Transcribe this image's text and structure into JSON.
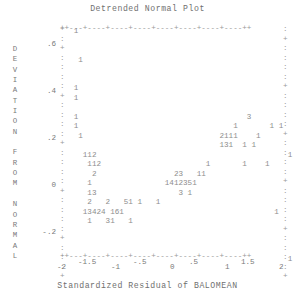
{
  "chart_data": {
    "type": "scatter",
    "title": "Detrended Normal Plot",
    "xlabel": "Standardized Residual of BALOMEAN",
    "ylabel": "DEVIATION FROM NORMAL",
    "grid": false,
    "legend": "none",
    "xlim": [
      -2,
      2
    ],
    "ylim": [
      -0.32,
      0.68
    ],
    "xticks": [
      -2,
      -1.5,
      -1,
      -0.5,
      0,
      0.5,
      1,
      1.5,
      2
    ],
    "xtick_labels": [
      "-2",
      "-1.5",
      "-1",
      "-.5",
      "0",
      ".5",
      "1",
      "1.5",
      "2"
    ],
    "yticks": [
      0.6,
      0.4,
      0.2,
      0,
      -0.2
    ],
    "ytick_labels": [
      ".6",
      ".4",
      ".2",
      "0",
      "-.2"
    ],
    "note": "ASCII character plot; each printed digit is a count of overlapping cases at that cell",
    "points": [
      {
        "x": -1.74,
        "y": 0.655,
        "count": 1
      },
      {
        "x": -1.68,
        "y": 0.505,
        "count": 1
      },
      {
        "x": -1.74,
        "y": 0.335,
        "count": 1
      },
      {
        "x": -1.74,
        "y": 0.295,
        "count": 1
      },
      {
        "x": -1.74,
        "y": 0.225,
        "count": 1
      },
      {
        "x": -1.7,
        "y": 0.185,
        "count": 1
      },
      {
        "x": -1.6,
        "y": 0.105,
        "count": 1
      },
      {
        "x": -1.54,
        "y": 0.105,
        "count": 1
      },
      {
        "x": -1.48,
        "y": 0.105,
        "count": 2
      },
      {
        "x": -1.56,
        "y": 0.065,
        "count": 1
      },
      {
        "x": -1.5,
        "y": 0.065,
        "count": 1
      },
      {
        "x": -1.44,
        "y": 0.065,
        "count": 2
      },
      {
        "x": -1.52,
        "y": 0.025,
        "count": 2
      },
      {
        "x": -1.54,
        "y": -0.015,
        "count": 1
      },
      {
        "x": -1.54,
        "y": -0.055,
        "count": 1
      },
      {
        "x": -1.48,
        "y": -0.055,
        "count": 3
      },
      {
        "x": -1.52,
        "y": -0.095,
        "count": 2
      },
      {
        "x": -1.36,
        "y": -0.095,
        "count": 2
      },
      {
        "x": -1.16,
        "y": -0.095,
        "count": 5
      },
      {
        "x": -1.1,
        "y": -0.095,
        "count": 1
      },
      {
        "x": -0.98,
        "y": -0.095,
        "count": 1
      },
      {
        "x": -0.88,
        "y": -0.095,
        "count": 1
      },
      {
        "x": -1.54,
        "y": -0.135,
        "count": 1
      },
      {
        "x": -1.48,
        "y": -0.135,
        "count": 3
      },
      {
        "x": -1.42,
        "y": -0.135,
        "count": 4
      },
      {
        "x": -1.36,
        "y": -0.135,
        "count": 2
      },
      {
        "x": -1.3,
        "y": -0.135,
        "count": 4
      },
      {
        "x": -1.18,
        "y": -0.135,
        "count": 1
      },
      {
        "x": -1.12,
        "y": -0.135,
        "count": 6
      },
      {
        "x": -1.06,
        "y": -0.135,
        "count": 1
      },
      {
        "x": -1.5,
        "y": -0.175,
        "count": 1
      },
      {
        "x": -1.32,
        "y": -0.175,
        "count": 3
      },
      {
        "x": -1.26,
        "y": -0.175,
        "count": 1
      },
      {
        "x": -1.1,
        "y": -0.175,
        "count": 1
      },
      {
        "x": -0.28,
        "y": -0.015,
        "count": 2
      },
      {
        "x": -0.22,
        "y": -0.015,
        "count": 3
      },
      {
        "x": -0.08,
        "y": -0.015,
        "count": 1
      },
      {
        "x": -0.02,
        "y": -0.015,
        "count": 1
      },
      {
        "x": -0.32,
        "y": -0.055,
        "count": 1
      },
      {
        "x": -0.26,
        "y": -0.055,
        "count": 4
      },
      {
        "x": -0.2,
        "y": -0.055,
        "count": 1
      },
      {
        "x": -0.14,
        "y": -0.055,
        "count": 2
      },
      {
        "x": -0.08,
        "y": -0.055,
        "count": 3
      },
      {
        "x": -0.02,
        "y": -0.055,
        "count": 5
      },
      {
        "x": 0.04,
        "y": -0.055,
        "count": 1
      },
      {
        "x": -0.08,
        "y": -0.095,
        "count": 3
      },
      {
        "x": 0.0,
        "y": -0.095,
        "count": 1
      },
      {
        "x": 0.62,
        "y": 0.145,
        "count": 3
      },
      {
        "x": 0.56,
        "y": 0.105,
        "count": 1
      },
      {
        "x": 1.12,
        "y": 0.105,
        "count": 1
      },
      {
        "x": 1.26,
        "y": 0.105,
        "count": 1
      },
      {
        "x": 0.46,
        "y": 0.065,
        "count": 2
      },
      {
        "x": 0.52,
        "y": 0.065,
        "count": 1
      },
      {
        "x": 0.58,
        "y": 0.065,
        "count": 1
      },
      {
        "x": 0.64,
        "y": 0.065,
        "count": 1
      },
      {
        "x": 0.88,
        "y": 0.065,
        "count": 1
      },
      {
        "x": 0.46,
        "y": 0.025,
        "count": 1
      },
      {
        "x": 0.52,
        "y": 0.025,
        "count": 3
      },
      {
        "x": 0.58,
        "y": 0.025,
        "count": 1
      },
      {
        "x": 0.8,
        "y": 0.025,
        "count": 1
      },
      {
        "x": 0.94,
        "y": 0.025,
        "count": 1
      },
      {
        "x": 1.4,
        "y": -0.015,
        "count": 1
      },
      {
        "x": 0.46,
        "y": -0.055,
        "count": 1
      },
      {
        "x": 0.94,
        "y": -0.055,
        "count": 1
      },
      {
        "x": 1.22,
        "y": -0.055,
        "count": 1
      },
      {
        "x": 1.82,
        "y": -0.215,
        "count": 1
      },
      {
        "x": 1.88,
        "y": -0.295,
        "count": 1
      }
    ]
  },
  "axis": {
    "top_row": "++---+----+----+----+----+----+----+----++",
    "bottom_row": "++---+----+----+----+----+----+----+----++",
    "left_marks": [
      "+",
      ":",
      "+",
      ":",
      ":",
      ":",
      ":",
      "+",
      ":",
      ":",
      ":",
      ":",
      "+",
      ":",
      ":",
      ":",
      ":",
      "+",
      ":",
      ":",
      ":",
      ":",
      "+",
      ":",
      ":",
      ":",
      "+"
    ],
    "right_marks": [
      ":",
      "+",
      ":",
      ":",
      ":",
      ":",
      "+",
      ":",
      ":",
      ":",
      ":",
      "+",
      ":",
      ":",
      ":",
      ":",
      "+",
      ":",
      ":",
      ":",
      ":",
      "+",
      ":",
      ":",
      ":",
      ":",
      "+"
    ],
    "ylabel_letters": [
      "D",
      "E",
      "V",
      "I",
      "A",
      "T",
      "I",
      "O",
      "N",
      "",
      "F",
      "R",
      "O",
      "M",
      "",
      "N",
      "O",
      "R",
      "M",
      "A",
      "L"
    ]
  },
  "plot_rows": [
    {
      "top": 0,
      "text": "   1"
    },
    {
      "top": 9.5,
      "text": ""
    },
    {
      "top": 19,
      "text": ""
    },
    {
      "top": 28.5,
      "text": "    1"
    },
    {
      "top": 38,
      "text": ""
    },
    {
      "top": 47.5,
      "text": ""
    },
    {
      "top": 57,
      "text": "   1"
    },
    {
      "top": 66.5,
      "text": "   1"
    },
    {
      "top": 76,
      "text": ""
    },
    {
      "top": 85.5,
      "text": "   1                                     3"
    },
    {
      "top": 95,
      "text": "   1                                  1       1 1"
    },
    {
      "top": 104.5,
      "text": "    1                              2111    1"
    },
    {
      "top": 114,
      "text": "                                   131  1 1"
    },
    {
      "top": 123.5,
      "text": "     112                                          1"
    },
    {
      "top": 133,
      "text": "      112                       1       1    1"
    },
    {
      "top": 142.5,
      "text": "       2                 23   11"
    },
    {
      "top": 152,
      "text": "      1                1412351"
    },
    {
      "top": 161.5,
      "text": "      13                  3 1"
    },
    {
      "top": 171,
      "text": "      2   2   51 1   1"
    },
    {
      "top": 180.5,
      "text": "     13424 161                                 1"
    },
    {
      "top": 190,
      "text": "      1   31   1"
    },
    {
      "top": 199.5,
      "text": ""
    },
    {
      "top": 209,
      "text": ""
    },
    {
      "top": 218.5,
      "text": ""
    },
    {
      "top": 228,
      "text": "                                                  1"
    }
  ],
  "y_tick_positions": [
    {
      "label": ".6",
      "top": 41
    },
    {
      "label": ".4",
      "top": 88
    },
    {
      "label": ".2",
      "top": 135
    },
    {
      "label": "0",
      "top": 182
    },
    {
      "label": "-.2",
      "top": 229
    }
  ],
  "x_tick_positions": [
    {
      "label": "-2",
      "left": 57,
      "top": 263
    },
    {
      "label": "-1.5",
      "left": 78,
      "top": 258
    },
    {
      "label": "-1",
      "left": 111,
      "top": 263
    },
    {
      "label": "-.5",
      "left": 133,
      "top": 258
    },
    {
      "label": "0",
      "left": 170,
      "top": 263
    },
    {
      "label": ".5",
      "left": 189,
      "top": 258
    },
    {
      "label": "1",
      "left": 225,
      "top": 263
    },
    {
      "label": "1.5",
      "left": 241,
      "top": 258
    },
    {
      "label": "2",
      "left": 279,
      "top": 263
    }
  ]
}
